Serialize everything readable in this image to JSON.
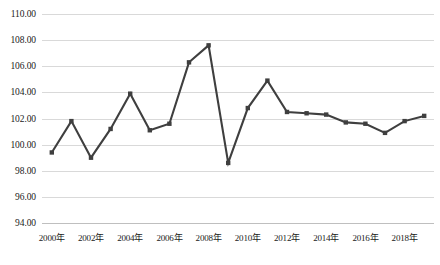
{
  "chart_data": {
    "type": "line",
    "title": "",
    "xlabel": "",
    "ylabel": "",
    "ylim": [
      94.0,
      110.0
    ],
    "ytick_step": 2.0,
    "grid": true,
    "legend": "none",
    "line_color": "#3f3f3f",
    "gridline_color": "#d9d9d9",
    "marker": "square",
    "x": [
      2000,
      2001,
      2002,
      2003,
      2004,
      2005,
      2006,
      2007,
      2008,
      2009,
      2010,
      2011,
      2012,
      2013,
      2014,
      2015,
      2016,
      2017,
      2018,
      2019
    ],
    "values": [
      99.4,
      101.8,
      99.0,
      101.2,
      103.9,
      101.1,
      101.6,
      106.3,
      107.6,
      98.6,
      102.8,
      104.9,
      102.5,
      102.4,
      102.3,
      101.7,
      101.6,
      100.9,
      101.8,
      102.2
    ],
    "ytick_labels": [
      "110.00",
      "108.00",
      "106.00",
      "104.00",
      "102.00",
      "100.00",
      "98.00",
      "96.00",
      "94.00"
    ],
    "ytick_values": [
      110.0,
      108.0,
      106.0,
      104.0,
      102.0,
      100.0,
      98.0,
      96.0,
      94.0
    ],
    "xtick_labels": [
      "2000年",
      "2002年",
      "2004年",
      "2006年",
      "2008年",
      "2010年",
      "2012年",
      "2014年",
      "2016年",
      "2018年"
    ],
    "xtick_values": [
      2000,
      2002,
      2004,
      2006,
      2008,
      2010,
      2012,
      2014,
      2016,
      2018
    ]
  }
}
